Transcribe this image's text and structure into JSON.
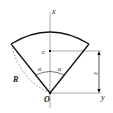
{
  "diagram": {
    "labels": {
      "x_axis": "x",
      "y_axis": "y",
      "centroid": "c",
      "origin": "O",
      "radius": "R",
      "angle_left": "α",
      "angle_right": "α",
      "centroid_distance": "x̄"
    },
    "colors": {
      "stroke": "#111111",
      "axis": "#777777",
      "dashed": "#888888"
    }
  }
}
